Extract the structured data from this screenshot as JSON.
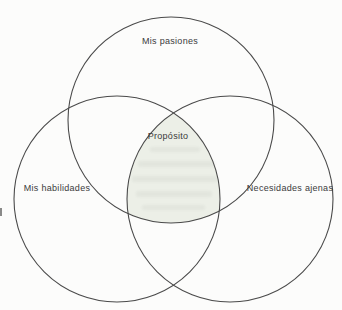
{
  "figure": {
    "type": "venn-diagram"
  },
  "venn": {
    "circles": [
      {
        "id": "pasiones",
        "label": "Mis pasiones",
        "position": "top"
      },
      {
        "id": "habilidades",
        "label": "Mis habilidades",
        "position": "bottom-left"
      },
      {
        "id": "ajenas",
        "label": "Necesidades ajenas",
        "position": "bottom-right"
      }
    ],
    "center": {
      "label": "Propósito"
    }
  },
  "colors": {
    "circle_stroke": "#4a4a4a",
    "label_text": "#3b3b3b",
    "center_fill": "#ecefe7",
    "page_background": "#fcfcfb"
  }
}
